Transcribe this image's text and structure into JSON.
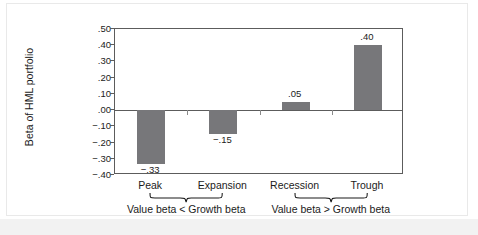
{
  "chart_data": {
    "type": "bar",
    "title": "",
    "xlabel": "",
    "ylabel": "Beta of HML portfolio",
    "categories": [
      "Peak",
      "Expansion",
      "Recession",
      "Trough"
    ],
    "values": [
      -0.33,
      -0.15,
      0.05,
      0.4
    ],
    "value_labels": [
      "−.33",
      "−.15",
      ".05",
      ".40"
    ],
    "ylim": [
      -0.4,
      0.5
    ],
    "ytick_values": [
      0.5,
      0.4,
      0.3,
      0.2,
      0.1,
      0.0,
      -0.1,
      -0.2,
      -0.3,
      -0.4
    ],
    "ytick_labels": [
      ".50",
      ".40",
      ".30",
      ".20",
      ".10",
      ".00",
      "−.10",
      "−.20",
      "−.30",
      "−.40"
    ],
    "grid": false,
    "legend": "none",
    "bar_color": "#77777a",
    "axis_color": "#5c5c5c",
    "annotations": [
      {
        "text": "Value beta < Growth beta",
        "covers": [
          "Peak",
          "Expansion"
        ]
      },
      {
        "text": "Value beta > Growth beta",
        "covers": [
          "Recession",
          "Trough"
        ]
      }
    ]
  },
  "figure": {
    "background": "#ffffff",
    "border_color": "#e9e9e9",
    "strip_color": "#f2f2f2"
  }
}
